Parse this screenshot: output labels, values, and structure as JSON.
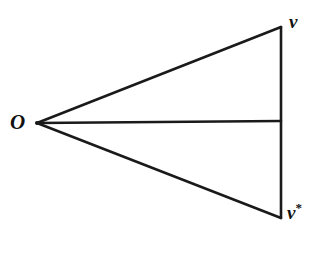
{
  "diagram": {
    "type": "geometric-figure",
    "stroke_color": "#1a1a1a",
    "background_color": "#ffffff",
    "points": {
      "O": {
        "label": "O",
        "x": 37,
        "y": 123
      },
      "v": {
        "label": "v",
        "x": 281,
        "y": 27
      },
      "v_star": {
        "label": "v",
        "superscript": "*",
        "x": 281,
        "y": 218
      },
      "mid": {
        "label": "",
        "x": 281,
        "y": 121
      }
    },
    "segments": [
      {
        "from": "O",
        "to": "v"
      },
      {
        "from": "O",
        "to": "v_star"
      },
      {
        "from": "O",
        "to": "mid"
      },
      {
        "from": "v",
        "to": "v_star"
      }
    ],
    "labels": {
      "origin": "O",
      "vertex_top": "v",
      "vertex_bottom": "v",
      "vertex_bottom_superscript": "*"
    }
  }
}
